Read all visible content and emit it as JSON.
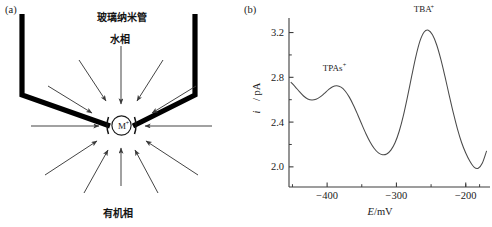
{
  "figure": {
    "panel_a": {
      "label": "(a)",
      "caption_tube": "玻璃纳米管",
      "caption_aqueous": "水相",
      "caption_organic": "有机相",
      "ion_label": "M",
      "ion_charge": "+",
      "colors": {
        "pipette": "#000000",
        "arrow": "#3a3a3a",
        "ion_circle": "#1a1a1a"
      },
      "arrow_count_top": 5,
      "arrow_count_bottom": 5,
      "arrow_count_side": 2
    },
    "panel_b": {
      "label": "(b)",
      "colors": {
        "axis": "#3d3d3d",
        "curve": "#4a4a4a"
      }
    }
  },
  "chart_data": {
    "type": "line",
    "title": "",
    "subtitle": "",
    "xlabel": "E/mV",
    "xlabel_symbol": "E",
    "xlabel_unit": "/mV",
    "ylabel": "i / pA",
    "ylabel_symbol": "i",
    "ylabel_unit": "/ pA",
    "xlim": [
      -455,
      -165
    ],
    "ylim": [
      1.82,
      3.33
    ],
    "xticks": [
      -400,
      -300,
      -200
    ],
    "xtick_labels": [
      "−400",
      "−300",
      "−200"
    ],
    "yticks": [
      2.0,
      2.4,
      2.8,
      3.2
    ],
    "ytick_labels": [
      "2.0",
      "2.4",
      "2.8",
      "3.2"
    ],
    "xminor_ticks": [
      -450,
      -350,
      -250,
      -200,
      -180
    ],
    "yminor_ticks": [
      2.2,
      2.6,
      3.0
    ],
    "grid": false,
    "legend": false,
    "annotations": [
      {
        "text": "TPAs",
        "sup": "+",
        "x": -392,
        "y": 2.86,
        "peak_x": -395,
        "peak_y": 2.72
      },
      {
        "text": "TBA",
        "sup": "+",
        "x": -262,
        "y": 3.38,
        "peak_x": -258,
        "peak_y": 3.22
      }
    ],
    "series": [
      {
        "name": "voltammogram",
        "x": [
          -452,
          -446,
          -440,
          -434,
          -428,
          -422,
          -416,
          -410,
          -404,
          -398,
          -392,
          -386,
          -380,
          -374,
          -368,
          -362,
          -356,
          -350,
          -344,
          -338,
          -332,
          -326,
          -320,
          -314,
          -308,
          -302,
          -296,
          -290,
          -284,
          -278,
          -272,
          -266,
          -260,
          -254,
          -248,
          -242,
          -236,
          -230,
          -224,
          -218,
          -212,
          -206,
          -200,
          -194,
          -188,
          -182,
          -176,
          -170
        ],
        "y": [
          2.755,
          2.715,
          2.672,
          2.633,
          2.607,
          2.597,
          2.604,
          2.625,
          2.656,
          2.69,
          2.716,
          2.724,
          2.712,
          2.678,
          2.623,
          2.551,
          2.468,
          2.38,
          2.296,
          2.222,
          2.164,
          2.125,
          2.108,
          2.115,
          2.149,
          2.215,
          2.318,
          2.458,
          2.628,
          2.81,
          2.985,
          3.125,
          3.205,
          3.221,
          3.18,
          3.091,
          2.962,
          2.808,
          2.644,
          2.484,
          2.34,
          2.218,
          2.124,
          2.05,
          1.998,
          1.988,
          2.035,
          2.14
        ]
      }
    ]
  }
}
